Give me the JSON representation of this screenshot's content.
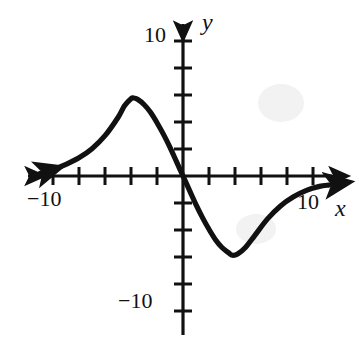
{
  "figure": {
    "kind": "math-graph",
    "background_color": "#ffffff",
    "ink_color": "#111111"
  },
  "axis_names": {
    "x": "x",
    "y": "y"
  },
  "labels": {
    "y_top": "10",
    "y_bottom": "−10",
    "x_left": "−10",
    "x_right": "10"
  },
  "chart_data": {
    "type": "line",
    "title": "",
    "xlabel": "x",
    "ylabel": "y",
    "xlim": [
      -11.5,
      11.5
    ],
    "ylim": [
      -12.5,
      11.5
    ],
    "grid": false,
    "legend": null,
    "axis": {
      "x_tick_values": [
        -10,
        -8,
        -6,
        -4,
        -2,
        2,
        4,
        6,
        8,
        10
      ],
      "y_tick_values": [
        -10,
        -8,
        -6,
        -4,
        -2,
        2,
        4,
        6,
        8,
        10
      ],
      "x_tick_labels_shown": [
        "-10",
        "10"
      ],
      "y_tick_labels_shown": [
        "10",
        "-10"
      ],
      "tick_step": 2,
      "arrowheads": [
        "left",
        "right",
        "up",
        "down"
      ]
    },
    "series": [
      {
        "name": "curve",
        "description": "Odd S-shaped curve: rises from left horizontal asymptote near y=0 to a local maximum near (-3.8, 6), passes through the origin with steep negative slope, falls to a local minimum near (3.8, -6), then rises back toward y=0 on the right; both ends terminate in arrowheads.",
        "local_maximum": [
          -3.8,
          6.0
        ],
        "local_minimum": [
          3.8,
          -6.1
        ],
        "x_intercepts": [
          0
        ],
        "y_intercepts": [
          0
        ],
        "end_behavior_left": "approaches 0 from above",
        "end_behavior_right": "approaches 0 from below",
        "points": [
          [
            -11.0,
            0.2
          ],
          [
            -10.0,
            0.5
          ],
          [
            -9.0,
            0.9
          ],
          [
            -8.0,
            1.4
          ],
          [
            -7.0,
            2.1
          ],
          [
            -6.0,
            3.1
          ],
          [
            -5.0,
            4.5
          ],
          [
            -4.5,
            5.4
          ],
          [
            -4.0,
            5.95
          ],
          [
            -3.8,
            6.0
          ],
          [
            -3.5,
            5.9
          ],
          [
            -3.0,
            5.5
          ],
          [
            -2.5,
            4.9
          ],
          [
            -2.0,
            4.1
          ],
          [
            -1.5,
            3.2
          ],
          [
            -1.0,
            2.2
          ],
          [
            -0.5,
            1.1
          ],
          [
            0.0,
            0.0
          ],
          [
            0.5,
            -1.1
          ],
          [
            1.0,
            -2.2
          ],
          [
            1.5,
            -3.2
          ],
          [
            2.0,
            -4.1
          ],
          [
            2.5,
            -4.9
          ],
          [
            3.0,
            -5.5
          ],
          [
            3.5,
            -5.9
          ],
          [
            3.8,
            -6.1
          ],
          [
            4.2,
            -6.0
          ],
          [
            4.8,
            -5.5
          ],
          [
            5.5,
            -4.6
          ],
          [
            6.5,
            -3.3
          ],
          [
            7.5,
            -2.3
          ],
          [
            8.5,
            -1.6
          ],
          [
            9.5,
            -1.1
          ],
          [
            10.5,
            -0.8
          ],
          [
            11.2,
            -0.7
          ]
        ]
      }
    ]
  }
}
